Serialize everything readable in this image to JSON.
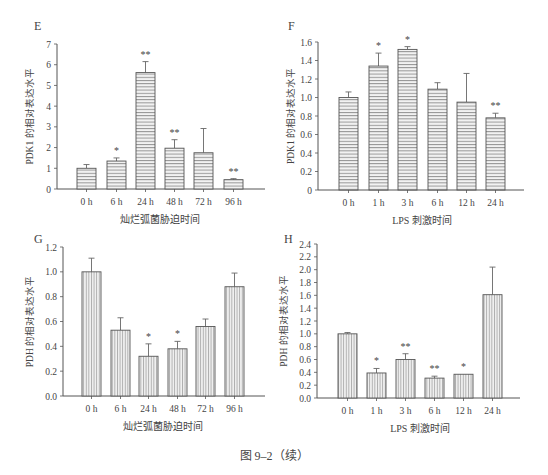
{
  "figure_caption": "图 9–2（续）",
  "chart_data": [
    {
      "panel": "E",
      "type": "bar",
      "title": "",
      "xlabel": "灿烂弧菌胁迫时间",
      "ylabel": "PDK1 的相对表达水平",
      "categories": [
        "0 h",
        "6 h",
        "24 h",
        "48 h",
        "72 h",
        "96 h"
      ],
      "values": [
        1.0,
        1.35,
        5.62,
        1.97,
        1.75,
        0.45
      ],
      "error_upper": [
        1.18,
        1.5,
        6.15,
        2.38,
        2.92,
        0.5
      ],
      "significance": [
        "",
        "*",
        "**",
        "**",
        "",
        "**"
      ],
      "ylim": [
        0,
        7
      ],
      "yticks": [
        "0",
        "1",
        "2",
        "3",
        "4",
        "5",
        "6",
        "7"
      ],
      "hatch": "horizontal",
      "grid": false,
      "legend": null
    },
    {
      "panel": "F",
      "type": "bar",
      "title": "",
      "xlabel": "LPS 刺激时间",
      "ylabel": "PDK1 的相对表达水平",
      "categories": [
        "0 h",
        "1 h",
        "3 h",
        "6 h",
        "12 h",
        "24 h"
      ],
      "values": [
        1.0,
        1.34,
        1.52,
        1.09,
        0.95,
        0.78
      ],
      "error_upper": [
        1.06,
        1.48,
        1.55,
        1.16,
        1.26,
        0.83
      ],
      "significance": [
        "",
        "*",
        "*",
        "",
        "",
        "**"
      ],
      "ylim": [
        0,
        1.6
      ],
      "yticks": [
        "0",
        "0.2",
        "0.4",
        "0.6",
        "0.8",
        "1.0",
        "1.2",
        "1.4",
        "1.6"
      ],
      "hatch": "horizontal",
      "grid": false,
      "legend": null
    },
    {
      "panel": "G",
      "type": "bar",
      "title": "",
      "xlabel": "灿烂弧菌胁迫时间",
      "ylabel": "PDH 的相对表达水平",
      "categories": [
        "0 h",
        "6 h",
        "24 h",
        "48 h",
        "72 h",
        "96 h"
      ],
      "values": [
        1.0,
        0.53,
        0.32,
        0.38,
        0.56,
        0.88
      ],
      "error_upper": [
        1.11,
        0.63,
        0.42,
        0.44,
        0.62,
        0.99
      ],
      "significance": [
        "",
        "",
        "*",
        "*",
        "",
        ""
      ],
      "ylim": [
        0,
        1.2
      ],
      "yticks": [
        "0.0",
        "0.2",
        "0.4",
        "0.6",
        "0.8",
        "1.0",
        "1.2"
      ],
      "hatch": "vertical",
      "grid": false,
      "legend": null
    },
    {
      "panel": "H",
      "type": "bar",
      "title": "",
      "xlabel": "LPS 刺激时间",
      "ylabel": "PDH 的相对表达水平",
      "categories": [
        "0 h",
        "1 h",
        "3 h",
        "6 h",
        "12 h",
        "24 h"
      ],
      "values": [
        1.0,
        0.39,
        0.6,
        0.31,
        0.37,
        1.61
      ],
      "error_upper": [
        1.02,
        0.46,
        0.69,
        0.34,
        0.37,
        2.04
      ],
      "significance": [
        "",
        "*",
        "**",
        "**",
        "*",
        ""
      ],
      "ylim": [
        0,
        2.4
      ],
      "yticks": [
        "0.0",
        "0.2",
        "0.4",
        "0.6",
        "0.8",
        "1.0",
        "1.2",
        "1.4",
        "1.6",
        "1.8",
        "2.0",
        "2.2",
        "2.4"
      ],
      "hatch": "vertical",
      "grid": false,
      "legend": null
    }
  ]
}
